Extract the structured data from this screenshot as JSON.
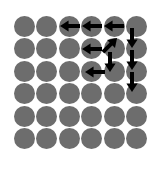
{
  "figure": {
    "name": "circle-grid-with-direction-arrows",
    "width": 159,
    "height": 169,
    "background_color": "#ffffff"
  },
  "grid": {
    "rows": 6,
    "cols": 6,
    "dot_color": "#6d6d6d",
    "dot_diameter": 21,
    "spacing_x": 22.4,
    "spacing_y": 22.4,
    "origin_x": 14,
    "origin_y": 16
  },
  "arrows": {
    "color": "#000000",
    "shaft_thickness": 4,
    "head_size": 9,
    "items": [
      {
        "name": "arrow-left-r1-c3c4",
        "direction": "left",
        "x": 70,
        "y": 26
      },
      {
        "name": "arrow-left-r1-c4c5",
        "direction": "left",
        "x": 92,
        "y": 26
      },
      {
        "name": "arrow-left-r1-c5c6",
        "direction": "left",
        "x": 114,
        "y": 26
      },
      {
        "name": "arrow-left-r2-c4c5",
        "direction": "left",
        "x": 92,
        "y": 49
      },
      {
        "name": "arrow-up-right-r2-c5",
        "direction": "up-right",
        "x": 110,
        "y": 45
      },
      {
        "name": "arrow-down-c6-r1r2",
        "direction": "down",
        "x": 132,
        "y": 38
      },
      {
        "name": "arrow-down-c6-r2r3",
        "direction": "down",
        "x": 132,
        "y": 60
      },
      {
        "name": "arrow-down-c6-r3r4",
        "direction": "down",
        "x": 132,
        "y": 82
      },
      {
        "name": "arrow-down-c5-r2r3",
        "direction": "down",
        "x": 110,
        "y": 62
      },
      {
        "name": "arrow-left-r3-c4c5",
        "direction": "left",
        "x": 95,
        "y": 72
      }
    ]
  }
}
